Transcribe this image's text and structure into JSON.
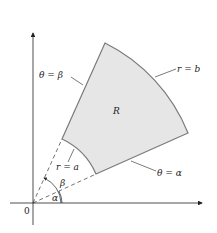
{
  "figure": {
    "region_label": "R",
    "origin_label": "0",
    "labels": {
      "theta_beta": "θ = β",
      "theta_alpha": "θ = α",
      "r_outer": "r = b",
      "r_inner": "r = a",
      "angle_alpha": "α",
      "angle_beta": "β"
    },
    "colors": {
      "region_fill": "#e6e6e6",
      "region_stroke": "#7a7a7a",
      "axis": "#222222"
    }
  }
}
